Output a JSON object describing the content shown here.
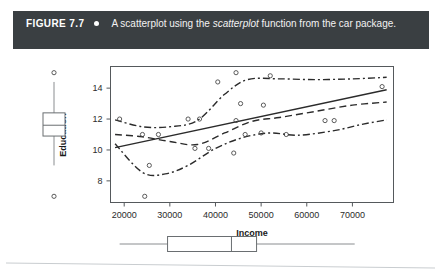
{
  "figure": {
    "label": "FIGURE 7.7",
    "bullet_icon": "bullet-dot-icon",
    "caption_before": "A scatterplot using the ",
    "caption_italic": "scatterplot",
    "caption_after": " function from the car package.",
    "banner_color": "#3a3f42",
    "banner_text_color": "#ffffff"
  },
  "chart_data": {
    "type": "scatter",
    "title": "",
    "xlabel": "Income",
    "ylabel": "Education",
    "xlim": [
      17000,
      79000
    ],
    "ylim": [
      6.6,
      15.4
    ],
    "xticks": [
      20000,
      30000,
      40000,
      50000,
      60000,
      70000
    ],
    "xtick_labels": [
      "20000",
      "30000",
      "40000",
      "50000",
      "60000",
      "70000"
    ],
    "yticks": [
      8,
      10,
      12,
      14
    ],
    "ytick_labels": [
      "8",
      "10",
      "12",
      "14"
    ],
    "grid": false,
    "legend": "none",
    "points": [
      {
        "x": 19000,
        "y": 12.0
      },
      {
        "x": 24000,
        "y": 11.0
      },
      {
        "x": 27500,
        "y": 11.0
      },
      {
        "x": 25500,
        "y": 9.0
      },
      {
        "x": 24500,
        "y": 7.0
      },
      {
        "x": 34000,
        "y": 12.0
      },
      {
        "x": 36500,
        "y": 12.0
      },
      {
        "x": 35500,
        "y": 10.1
      },
      {
        "x": 38500,
        "y": 10.1
      },
      {
        "x": 40500,
        "y": 14.4
      },
      {
        "x": 44500,
        "y": 15.0
      },
      {
        "x": 44500,
        "y": 11.9
      },
      {
        "x": 45500,
        "y": 13.0
      },
      {
        "x": 46500,
        "y": 11.0
      },
      {
        "x": 44000,
        "y": 9.8
      },
      {
        "x": 52000,
        "y": 14.8
      },
      {
        "x": 50500,
        "y": 12.9
      },
      {
        "x": 50000,
        "y": 11.1
      },
      {
        "x": 55500,
        "y": 11.0
      },
      {
        "x": 64000,
        "y": 11.9
      },
      {
        "x": 66000,
        "y": 11.9
      },
      {
        "x": 76500,
        "y": 14.1
      }
    ],
    "lines": [
      {
        "name": "linear-regression",
        "style": "solid",
        "points": [
          [
            18000,
            10.15
          ],
          [
            77500,
            13.9
          ]
        ]
      },
      {
        "name": "loess-smooth",
        "style": "dashed",
        "points": [
          [
            18000,
            11.0
          ],
          [
            24000,
            10.85
          ],
          [
            30000,
            10.55
          ],
          [
            36000,
            10.35
          ],
          [
            42000,
            11.1
          ],
          [
            48000,
            11.85
          ],
          [
            54000,
            12.1
          ],
          [
            62000,
            12.5
          ],
          [
            70000,
            12.9
          ],
          [
            77500,
            13.1
          ]
        ]
      },
      {
        "name": "spread-upper",
        "style": "dash-dot",
        "points": [
          [
            18000,
            11.95
          ],
          [
            24000,
            11.5
          ],
          [
            30000,
            11.5
          ],
          [
            36000,
            11.9
          ],
          [
            42000,
            13.6
          ],
          [
            47000,
            14.55
          ],
          [
            54000,
            14.6
          ],
          [
            62000,
            14.55
          ],
          [
            70000,
            14.6
          ],
          [
            77500,
            14.7
          ]
        ]
      },
      {
        "name": "spread-lower",
        "style": "dash-dot",
        "points": [
          [
            18000,
            10.4
          ],
          [
            24000,
            8.55
          ],
          [
            29000,
            8.45
          ],
          [
            34000,
            9.0
          ],
          [
            40000,
            10.1
          ],
          [
            46000,
            10.8
          ],
          [
            52000,
            11.1
          ],
          [
            58000,
            10.95
          ],
          [
            66000,
            11.25
          ],
          [
            72000,
            11.65
          ],
          [
            77500,
            11.95
          ]
        ]
      }
    ],
    "marginal_boxplots": {
      "education_vertical": {
        "orientation": "vertical",
        "min_whisker": 9.0,
        "q1": 10.9,
        "median": 11.6,
        "q3": 12.4,
        "max_whisker": 14.4,
        "outliers": [
          15.0,
          7.0
        ]
      },
      "income_horizontal": {
        "orientation": "horizontal",
        "min_whisker": 19000,
        "q1": 29500,
        "median": 43500,
        "q3": 49000,
        "max_whisker": 70500,
        "outliers": []
      }
    }
  }
}
